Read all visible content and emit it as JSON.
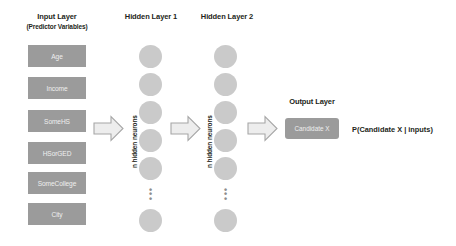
{
  "diagram": {
    "input_layer": {
      "title": "Input Layer",
      "subtitle": "(Predictor Variables)",
      "nodes": [
        {
          "label": "Age"
        },
        {
          "label": "Income"
        },
        {
          "label": "SomeHS"
        },
        {
          "label": "HSorGED"
        },
        {
          "label": "SomeCollege"
        },
        {
          "label": "City"
        }
      ]
    },
    "hidden_layer_1": {
      "title": "Hidden Layer 1",
      "vertical_label": "n hidden neurons",
      "neuron_count_shown": 6,
      "ellipsis": "⋮"
    },
    "hidden_layer_2": {
      "title": "Hidden Layer 2",
      "vertical_label": "n hidden neurons",
      "neuron_count_shown": 6,
      "ellipsis": "⋮"
    },
    "output_layer": {
      "title": "Output Layer",
      "node_label": "Candidate X"
    },
    "result": {
      "formula": "P(Candidate X | inputs)"
    },
    "arrows": [
      {
        "name": "input-to-hidden1"
      },
      {
        "name": "hidden1-to-hidden2"
      },
      {
        "name": "hidden2-to-output"
      }
    ],
    "colors": {
      "box_fill": "#9b9b9b",
      "box_text": "#efefef",
      "neuron_fill": "#cacaca",
      "arrow_fill": "#ededed",
      "arrow_stroke": "#a6a6a6",
      "text": "#231f20",
      "background": "#ffffff"
    }
  }
}
